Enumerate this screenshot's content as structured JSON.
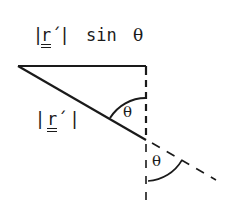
{
  "diagram": {
    "title": "",
    "labels": {
      "top": {
        "bar_left": "|",
        "vector": "r",
        "prime": "´",
        "bar_right": "|",
        "func": "sin",
        "angle": "θ"
      },
      "hypotenuse": {
        "bar_left": "|",
        "vector": "r",
        "prime": "´",
        "bar_right": "|"
      },
      "angle_upper": "θ",
      "angle_lower": "θ"
    },
    "colors": {
      "ink": "#1a1a1a",
      "background": "#ffffff"
    }
  }
}
